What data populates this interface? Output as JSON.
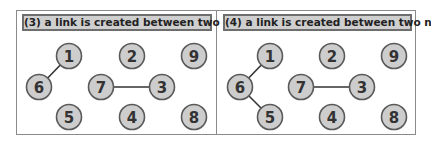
{
  "panels": [
    {
      "title": "(3) a link is created between two nodes",
      "nodes": [
        {
          "id": "1",
          "x": 69,
          "y": 56
        },
        {
          "id": "2",
          "x": 132,
          "y": 56
        },
        {
          "id": "9",
          "x": 194,
          "y": 56
        },
        {
          "id": "6",
          "x": 39,
          "y": 87
        },
        {
          "id": "7",
          "x": 101,
          "y": 87
        },
        {
          "id": "3",
          "x": 162,
          "y": 87
        },
        {
          "id": "5",
          "x": 69,
          "y": 117
        },
        {
          "id": "4",
          "x": 132,
          "y": 117
        },
        {
          "id": "8",
          "x": 194,
          "y": 117
        }
      ],
      "edges": [
        [
          "1",
          "6"
        ],
        [
          "7",
          "3"
        ]
      ]
    },
    {
      "title": "(4) a link is created between two nodes",
      "nodes": [
        {
          "id": "1",
          "x": 270,
          "y": 56
        },
        {
          "id": "2",
          "x": 332,
          "y": 56
        },
        {
          "id": "9",
          "x": 394,
          "y": 56
        },
        {
          "id": "6",
          "x": 240,
          "y": 87
        },
        {
          "id": "7",
          "x": 301,
          "y": 87
        },
        {
          "id": "3",
          "x": 362,
          "y": 87
        },
        {
          "id": "5",
          "x": 270,
          "y": 117
        },
        {
          "id": "4",
          "x": 332,
          "y": 117
        },
        {
          "id": "8",
          "x": 394,
          "y": 117
        }
      ],
      "edges": [
        [
          "1",
          "6"
        ],
        [
          "6",
          "5"
        ],
        [
          "7",
          "3"
        ]
      ]
    }
  ],
  "style": {
    "node_fill": "#cdcdcd",
    "node_stroke": "#5a5a5a",
    "edge_color": "#333333",
    "title_bg": "#cfcfcf"
  }
}
